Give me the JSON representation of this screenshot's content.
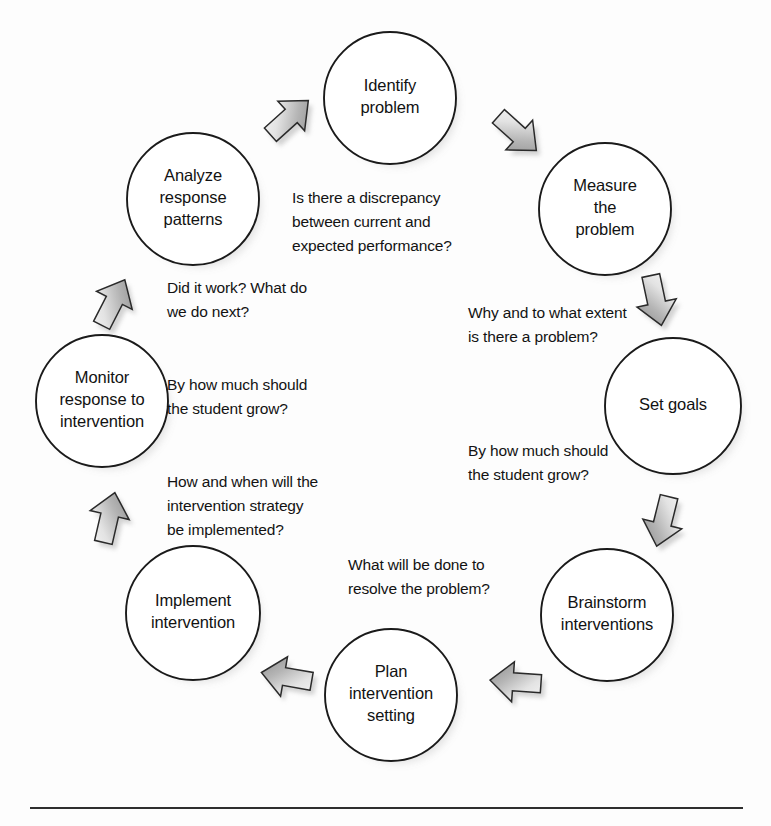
{
  "diagram": {
    "type": "cyclical-process-diagram",
    "colors": {
      "node_fill": "#ffffff",
      "node_stroke": "#1a1a1a",
      "arrow_light": "#f2f2f2",
      "arrow_dark": "#8f8f8f",
      "arrow_stroke": "#2a2a2a",
      "text": "#121212",
      "shadow": "#9a9a9a",
      "rule": "#2e2e2e"
    },
    "nodes": [
      {
        "id": "identify-problem",
        "lines": [
          "Identify",
          "problem"
        ],
        "cx": 390,
        "cy": 98,
        "r": 66
      },
      {
        "id": "measure-the-problem",
        "lines": [
          "Measure",
          "the",
          "problem"
        ],
        "cx": 605,
        "cy": 209,
        "r": 66
      },
      {
        "id": "set-goals",
        "lines": [
          "Set goals"
        ],
        "cx": 673,
        "cy": 406,
        "r": 68
      },
      {
        "id": "brainstorm-interventions",
        "lines": [
          "Brainstorm",
          "interventions"
        ],
        "cx": 607,
        "cy": 615,
        "r": 66
      },
      {
        "id": "plan-intervention-setting",
        "lines": [
          "Plan",
          "intervention",
          "setting"
        ],
        "cx": 391,
        "cy": 695,
        "r": 66
      },
      {
        "id": "implement-intervention",
        "lines": [
          "Implement",
          "intervention"
        ],
        "cx": 193,
        "cy": 613,
        "r": 67
      },
      {
        "id": "monitor-response",
        "lines": [
          "Monitor",
          "response to",
          "intervention"
        ],
        "cx": 102,
        "cy": 401,
        "r": 66
      },
      {
        "id": "analyze-response-patterns",
        "lines": [
          "Analyze",
          "response",
          "patterns"
        ],
        "cx": 193,
        "cy": 199,
        "r": 66
      }
    ],
    "arrows": [
      {
        "id": "arrow-analyze-to-identify",
        "x": 289,
        "y": 118,
        "angle": -42
      },
      {
        "id": "arrow-identify-to-measure",
        "x": 517,
        "y": 133,
        "angle": 42
      },
      {
        "id": "arrow-measure-to-setgoals",
        "x": 656,
        "y": 300,
        "angle": 78
      },
      {
        "id": "arrow-setgoals-to-brainstorm",
        "x": 663,
        "y": 521,
        "angle": 104
      },
      {
        "id": "arrow-brainstorm-to-plan",
        "x": 516,
        "y": 682,
        "angle": 184
      },
      {
        "id": "arrow-plan-to-implement",
        "x": 287,
        "y": 677,
        "angle": 190
      },
      {
        "id": "arrow-implement-to-monitor",
        "x": 109,
        "y": 518,
        "angle": 283
      },
      {
        "id": "arrow-monitor-to-analyze",
        "x": 113,
        "y": 303,
        "angle": 297
      }
    ],
    "annotations": [
      {
        "id": "annotation-identify",
        "x": 292,
        "y": 203,
        "lines": [
          "Is there a discrepancy",
          "between current and",
          "expected performance?"
        ]
      },
      {
        "id": "annotation-measure",
        "x": 468,
        "y": 318,
        "lines": [
          "Why and to what extent",
          "is there a problem?"
        ]
      },
      {
        "id": "annotation-setgoals",
        "x": 468,
        "y": 456,
        "lines": [
          "By how much should",
          "the student grow?"
        ]
      },
      {
        "id": "annotation-brainstorm",
        "x": 348,
        "y": 570,
        "lines": [
          "What will be done to",
          "resolve the problem?"
        ]
      },
      {
        "id": "annotation-implement",
        "x": 167,
        "y": 487,
        "lines": [
          "How and when will the",
          "intervention strategy",
          "be implemented?"
        ]
      },
      {
        "id": "annotation-monitor",
        "x": 167,
        "y": 390,
        "lines": [
          "By how much should",
          "the student grow?"
        ]
      },
      {
        "id": "annotation-analyze",
        "x": 167,
        "y": 293,
        "lines": [
          "Did it work? What do",
          "we do next?"
        ]
      }
    ],
    "rule": {
      "x1": 30,
      "x2": 743,
      "y": 808
    }
  }
}
